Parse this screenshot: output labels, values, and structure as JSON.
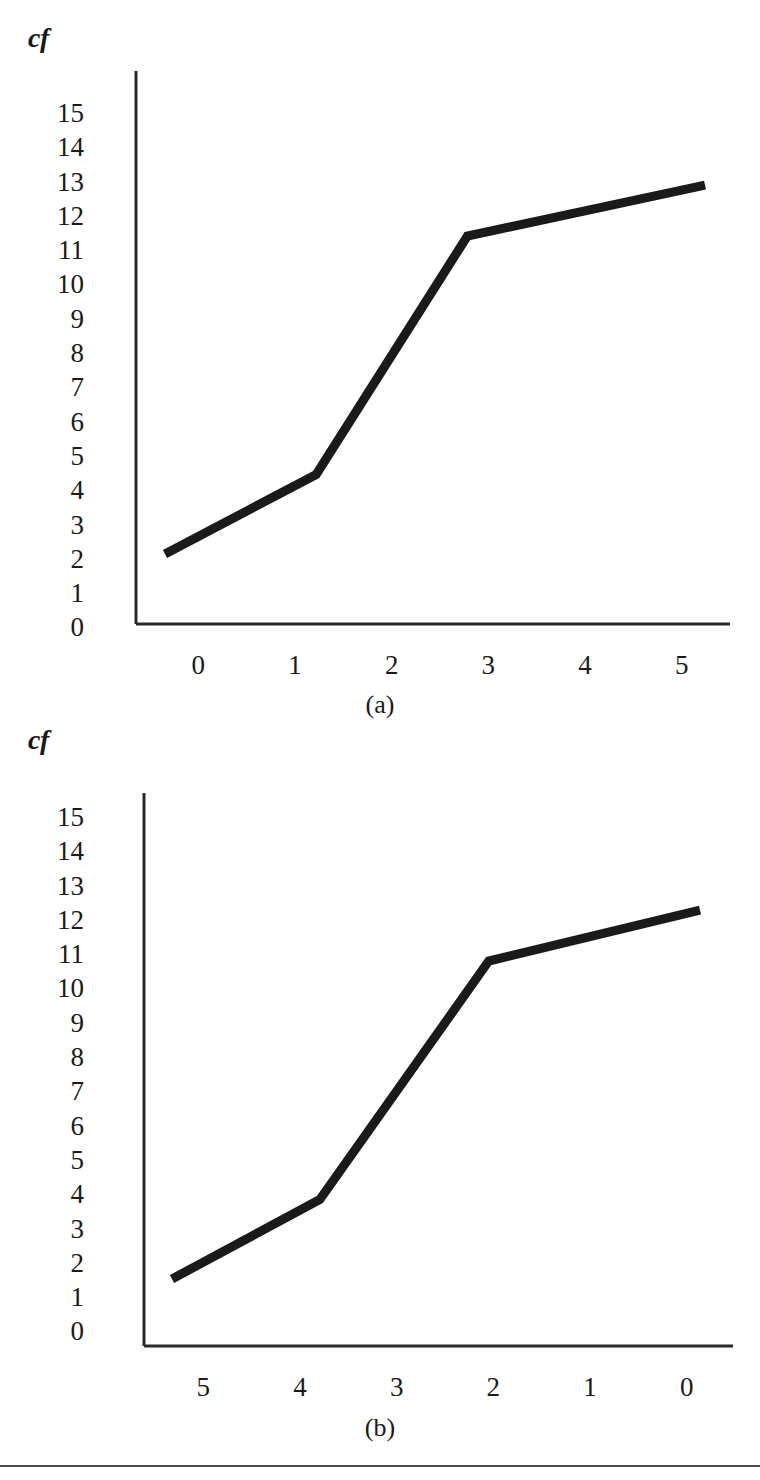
{
  "figures": [
    {
      "id": "a",
      "caption": "(a)",
      "axis_title": "cf",
      "y_ticks": [
        "15",
        "14",
        "13",
        "12",
        "11",
        "10",
        "9",
        "8",
        "7",
        "6",
        "5",
        "4",
        "3",
        "2",
        "1",
        "0"
      ],
      "x_ticks": [
        "0",
        "1",
        "2",
        "3",
        "4",
        "5"
      ]
    },
    {
      "id": "b",
      "caption": "(b)",
      "axis_title": "cf",
      "y_ticks": [
        "15",
        "14",
        "13",
        "12",
        "11",
        "10",
        "9",
        "8",
        "7",
        "6",
        "5",
        "4",
        "3",
        "2",
        "1",
        "0"
      ],
      "x_ticks": [
        "5",
        "4",
        "3",
        "2",
        "1",
        "0"
      ]
    }
  ],
  "chart_data": [
    {
      "type": "line",
      "title": "(a)",
      "xlabel": "",
      "ylabel": "cf",
      "x": [
        0,
        1.4,
        2.8,
        5
      ],
      "y": [
        2.2,
        4.7,
        12.2,
        13.8
      ],
      "categories": [
        "0",
        "1",
        "2",
        "3",
        "4",
        "5"
      ],
      "xlim": [
        0,
        5
      ],
      "ylim": [
        0,
        15
      ],
      "xtick_labels": [
        "0",
        "1",
        "2",
        "3",
        "4",
        "5"
      ],
      "ytick_labels": [
        "0",
        "1",
        "2",
        "3",
        "4",
        "5",
        "6",
        "7",
        "8",
        "9",
        "10",
        "11",
        "12",
        "13",
        "14",
        "15"
      ],
      "x_axis_direction": "ascending",
      "grid": false,
      "legend": "none",
      "series": [
        {
          "name": "cumulative frequency",
          "color": "#1a1a1a",
          "line_width_px": 9,
          "points": [
            {
              "x": 0.0,
              "y": 2.2
            },
            {
              "x": 1.4,
              "y": 4.7
            },
            {
              "x": 2.8,
              "y": 12.2
            },
            {
              "x": 5.0,
              "y": 13.8
            }
          ]
        }
      ]
    },
    {
      "type": "line",
      "title": "(b)",
      "xlabel": "",
      "ylabel": "cf",
      "x": [
        5,
        3.6,
        2.0,
        0
      ],
      "y": [
        2.2,
        4.7,
        12.2,
        13.8
      ],
      "categories": [
        "5",
        "4",
        "3",
        "2",
        "1",
        "0"
      ],
      "xlim": [
        5,
        0
      ],
      "ylim": [
        0,
        15
      ],
      "xtick_labels": [
        "5",
        "4",
        "3",
        "2",
        "1",
        "0"
      ],
      "ytick_labels": [
        "0",
        "1",
        "2",
        "3",
        "4",
        "5",
        "6",
        "7",
        "8",
        "9",
        "10",
        "11",
        "12",
        "13",
        "14",
        "15"
      ],
      "x_axis_direction": "descending",
      "grid": false,
      "legend": "none",
      "series": [
        {
          "name": "cumulative frequency",
          "color": "#1a1a1a",
          "line_width_px": 9,
          "points": [
            {
              "x": 5.0,
              "y": 2.2
            },
            {
              "x": 3.6,
              "y": 4.7
            },
            {
              "x": 2.0,
              "y": 12.2
            },
            {
              "x": 0.0,
              "y": 13.8
            }
          ]
        }
      ]
    }
  ],
  "colors": {
    "line": "#1a1a1a",
    "axis": "#2a2a2a",
    "text": "#1a1a1a",
    "rule": "#4a4a4a"
  }
}
